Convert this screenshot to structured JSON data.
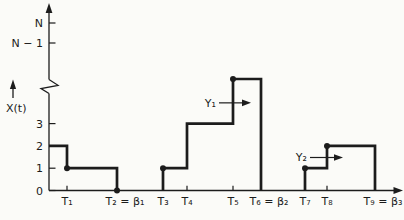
{
  "figure": {
    "background": "#fbfbf8",
    "line_color": "#1c1c1c",
    "y_axis_title": "X(t)"
  },
  "chart_data": {
    "type": "line",
    "subtype": "step-function",
    "title": "",
    "xlabel": "",
    "ylabel": "X(t)",
    "grid": "off",
    "y_axis_break_between": [
      "3",
      "N − 1"
    ],
    "x_ticks": [
      {
        "label": "T₁",
        "t": 18
      },
      {
        "label": "T₂ = β₁",
        "t": 68
      },
      {
        "label": "T₃",
        "t": 114
      },
      {
        "label": "T₄",
        "t": 138
      },
      {
        "label": "T₅",
        "t": 184
      },
      {
        "label": "T₆ = β₂",
        "t": 212
      },
      {
        "label": "T₇",
        "t": 256
      },
      {
        "label": "T₈",
        "t": 278
      },
      {
        "label": "T₉ = β₃",
        "t": 326
      }
    ],
    "y_ticks": [
      {
        "label": "0",
        "level": 0
      },
      {
        "label": "1",
        "level": 1
      },
      {
        "label": "2",
        "level": 2
      },
      {
        "label": "3",
        "level": 3
      },
      {
        "label": "N − 1",
        "level": "N-1"
      },
      {
        "label": "N",
        "level": "N"
      }
    ],
    "step_periods": [
      {
        "rise_from_axis": false,
        "breakpoints": [
          {
            "t": 0,
            "level": 2
          },
          {
            "t": 18,
            "level": 1
          }
        ],
        "end_t": 68
      },
      {
        "rise_from_axis": true,
        "breakpoints": [
          {
            "t": 114,
            "level": 1
          },
          {
            "t": 138,
            "level": 3
          },
          {
            "t": 184,
            "level": 5
          }
        ],
        "end_t": 212
      },
      {
        "rise_from_axis": true,
        "breakpoints": [
          {
            "t": 256,
            "level": 1
          },
          {
            "t": 278,
            "level": 2
          }
        ],
        "end_t": 326
      }
    ],
    "dots": [
      {
        "t": 18,
        "level": 1
      },
      {
        "t": 68,
        "level": 0
      },
      {
        "t": 114,
        "level": 1
      },
      {
        "t": 184,
        "level": 5
      },
      {
        "t": 256,
        "level": 1
      },
      {
        "t": 278,
        "level": 2
      }
    ],
    "annotations": [
      {
        "label": "Y₁",
        "from_t": 170,
        "to_t": 202,
        "level": 3.93
      },
      {
        "label": "Y₂",
        "from_t": 261,
        "to_t": 294,
        "level": 1.48
      }
    ]
  }
}
